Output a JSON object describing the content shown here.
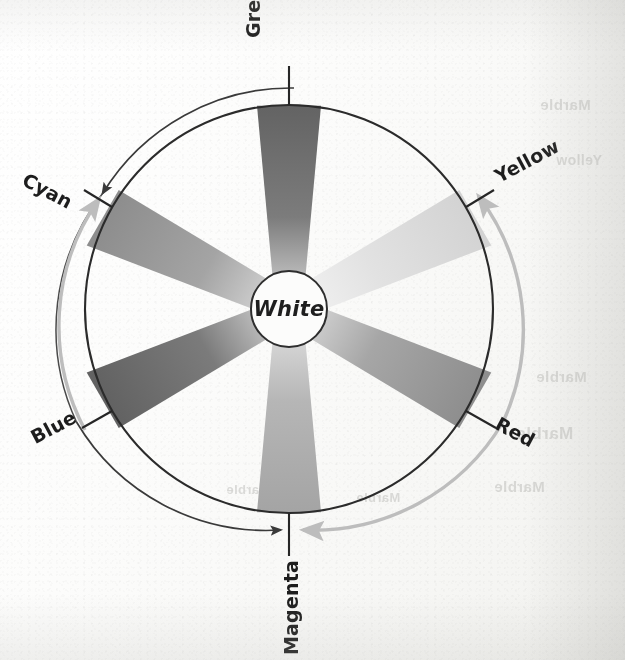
{
  "figure": {
    "kind": "additive-color-wheel",
    "center_label": "White",
    "spokes": [
      {
        "name": "Green",
        "angle_deg": 90,
        "tone": "#6e6e6e",
        "label_rotation_deg": -90
      },
      {
        "name": "Yellow",
        "angle_deg": 30,
        "tone": "#dcdcdc",
        "label_rotation_deg": -30
      },
      {
        "name": "Red",
        "angle_deg": -30,
        "tone": "#9a9a9a",
        "label_rotation_deg": 30
      },
      {
        "name": "Magenta",
        "angle_deg": -90,
        "tone": "#b0b0b0",
        "label_rotation_deg": -90
      },
      {
        "name": "Blue",
        "angle_deg": 210,
        "tone": "#6e6e6e",
        "label_rotation_deg": -30
      },
      {
        "name": "Cyan",
        "angle_deg": 150,
        "tone": "#9a9a9a",
        "label_rotation_deg": 30
      }
    ],
    "arrows": [
      {
        "name": "outer-arrow-green-to-cyan-to-magenta",
        "direction": "counterclockwise",
        "tone": "#3a3a3a"
      },
      {
        "name": "inner-arrow-yellow-to-magenta",
        "direction": "clockwise",
        "tone": "#b9b9b9"
      }
    ],
    "arc_rings": 2,
    "colors": {
      "ink": "#1d1d1d",
      "rule": "#2b2b2b",
      "paper": "#fbfbfa",
      "light_arc": "#c2c2c2"
    }
  },
  "ghost_text": [
    {
      "text": "Marble",
      "x": 540,
      "y": 96,
      "size": 15
    },
    {
      "text": "Yellow",
      "x": 556,
      "y": 152,
      "size": 14
    },
    {
      "text": "Marble",
      "x": 536,
      "y": 368,
      "size": 15
    },
    {
      "text": "Marble",
      "x": 516,
      "y": 424,
      "size": 17
    },
    {
      "text": "Marble",
      "x": 494,
      "y": 478,
      "size": 15
    },
    {
      "text": "Marble",
      "x": 226,
      "y": 482,
      "size": 13
    },
    {
      "text": "Marble",
      "x": 356,
      "y": 490,
      "size": 13
    }
  ],
  "chart_data": {
    "type": "pie",
    "categories": [
      "Green",
      "Yellow",
      "Red",
      "Magenta",
      "Blue",
      "Cyan"
    ],
    "values": [
      60,
      60,
      60,
      60,
      60,
      60
    ],
    "angles_deg": [
      90,
      30,
      -30,
      -90,
      210,
      150
    ],
    "grayscale_tones": [
      "#6e6e6e",
      "#dcdcdc",
      "#9a9a9a",
      "#b0b0b0",
      "#6e6e6e",
      "#9a9a9a"
    ],
    "center_label": "White",
    "xlabel": "",
    "ylabel": "",
    "legend": "none",
    "grid": false
  }
}
